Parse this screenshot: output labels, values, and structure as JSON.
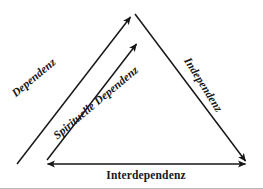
{
  "diagram": {
    "type": "triangle-relationship-diagram",
    "background_color": "#ffffff",
    "stroke_color": "#17171a",
    "labels": {
      "left_side": "Dependenz",
      "inner_diagonal": "Spirituelle Dependenz",
      "right_side": "Independenz",
      "bottom_side": "Interdependenz"
    },
    "edges": [
      {
        "name": "left-ascending-arrow",
        "label": "Dependenz",
        "from": [
          17,
          164
        ],
        "to": [
          133,
          14
        ],
        "arrowheads": "end"
      },
      {
        "name": "inner-ascending-arrow",
        "label": "Spirituelle Dependenz",
        "from": [
          47,
          160
        ],
        "to": [
          139,
          41
        ],
        "arrowheads": "end"
      },
      {
        "name": "right-descending-arrow",
        "label": "Independenz",
        "from": [
          135,
          14
        ],
        "to": [
          247,
          164
        ],
        "arrowheads": "end"
      },
      {
        "name": "bottom-horizontal-arrow",
        "label": "Interdependenz",
        "from": [
          45,
          164
        ],
        "to": [
          248,
          164
        ],
        "arrowheads": "both"
      }
    ]
  }
}
